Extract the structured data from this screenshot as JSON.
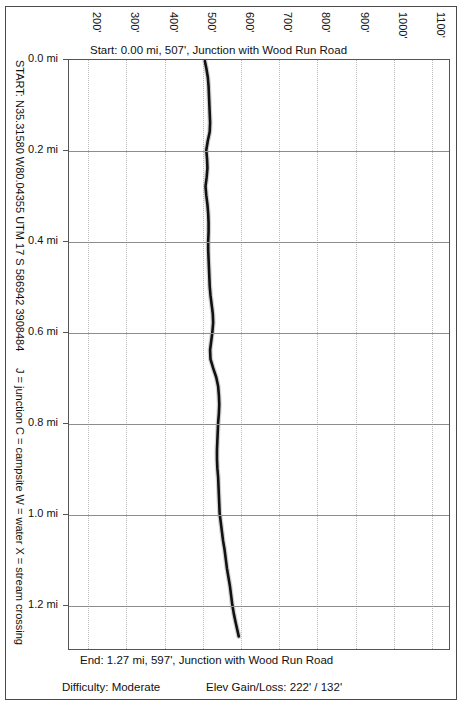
{
  "annotations": {
    "start_coords": "START: N35.31580 W80.04355   UTM 17 S 586942 3908484",
    "legend_key": "J = junction   C = campsite   W = water   X = stream crossing",
    "start_caption": "Start: 0.00 mi, 507', Junction with Wood Run Road",
    "end_caption": "End: 1.27 mi, 597', Junction with Wood Run Road",
    "difficulty": "Difficulty: Moderate",
    "gain_loss": "Elev Gain/Loss: 222' / 132'"
  },
  "colors": {
    "border": "#4a4a4a",
    "plot_border": "#555555",
    "grid_vertical": "#b9b9b9",
    "grid_horizontal": "#8d8d8d",
    "trace": "#111111",
    "background": "#ffffff"
  },
  "chart_data": {
    "type": "line",
    "title": "Start: 0.00 mi, 507', Junction with Wood Run Road",
    "subtitle": "End: 1.27 mi, 597', Junction with Wood Run Road",
    "orientation": "vertical-distance",
    "xlabel": "Elevation (feet)",
    "ylabel": "Distance (miles)",
    "xlim": [
      150,
      1150
    ],
    "ylim": [
      0.0,
      1.3
    ],
    "grid": true,
    "legend": "none",
    "x_ticks": [
      200,
      300,
      400,
      500,
      600,
      700,
      800,
      900,
      1000,
      1100
    ],
    "x_tick_labels": [
      "200'",
      "300'",
      "400'",
      "500'",
      "600'",
      "700'",
      "800'",
      "900'",
      "1000'",
      "1100'"
    ],
    "y_ticks": [
      0.0,
      0.2,
      0.4,
      0.6,
      0.8,
      1.0,
      1.2
    ],
    "y_tick_labels": [
      "0.0 mi",
      "0.2 mi",
      "0.4 mi",
      "0.6 mi",
      "0.8 mi",
      "1.0 mi",
      "1.2 mi"
    ],
    "series": [
      {
        "name": "Trail elevation profile",
        "distance_mi": [
          0.0,
          0.02,
          0.04,
          0.06,
          0.08,
          0.1,
          0.12,
          0.14,
          0.16,
          0.18,
          0.2,
          0.22,
          0.24,
          0.26,
          0.28,
          0.3,
          0.32,
          0.34,
          0.36,
          0.38,
          0.4,
          0.42,
          0.44,
          0.46,
          0.48,
          0.5,
          0.52,
          0.54,
          0.56,
          0.58,
          0.6,
          0.62,
          0.64,
          0.66,
          0.68,
          0.7,
          0.72,
          0.74,
          0.76,
          0.78,
          0.8,
          0.82,
          0.84,
          0.86,
          0.88,
          0.9,
          0.92,
          0.94,
          0.96,
          0.98,
          1.0,
          1.02,
          1.04,
          1.06,
          1.08,
          1.1,
          1.12,
          1.14,
          1.16,
          1.18,
          1.2,
          1.22,
          1.24,
          1.27
        ],
        "elevation_ft": [
          507,
          512,
          516,
          518,
          519,
          520,
          521,
          522,
          521,
          516,
          512,
          514,
          515,
          513,
          510,
          512,
          515,
          517,
          518,
          518,
          517,
          517,
          518,
          519,
          520,
          521,
          523,
          526,
          529,
          530,
          528,
          525,
          522,
          523,
          530,
          538,
          543,
          545,
          546,
          545,
          543,
          542,
          541,
          540,
          540,
          541,
          543,
          544,
          545,
          546,
          547,
          550,
          553,
          556,
          560,
          563,
          566,
          570,
          574,
          577,
          580,
          584,
          589,
          597
        ]
      }
    ],
    "summary": {
      "start_distance_mi": 0.0,
      "start_elevation_ft": 507,
      "end_distance_mi": 1.27,
      "end_elevation_ft": 597,
      "elev_gain_ft": 222,
      "elev_loss_ft": 132,
      "difficulty": "Moderate"
    }
  }
}
